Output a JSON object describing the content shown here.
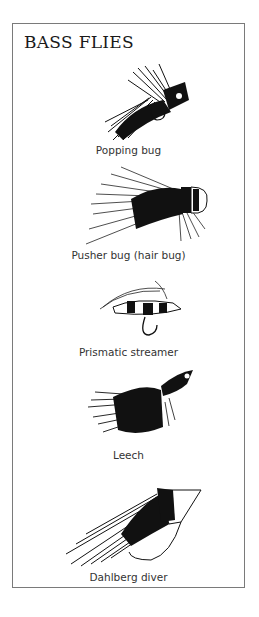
{
  "title": "BASS FLIES",
  "flies": [
    {
      "name": "Popping bug",
      "icon": "popping-bug-illustration"
    },
    {
      "name": "Pusher bug (hair bug)",
      "icon": "pusher-bug-illustration"
    },
    {
      "name": "Prismatic streamer",
      "icon": "prismatic-streamer-illustration"
    },
    {
      "name": "Leech",
      "icon": "leech-illustration"
    },
    {
      "name": "Dahlberg diver",
      "icon": "dahlberg-diver-illustration"
    }
  ],
  "colors": {
    "ink": "#1a1a1a",
    "border": "#7a7a7a",
    "paper": "#ffffff"
  }
}
